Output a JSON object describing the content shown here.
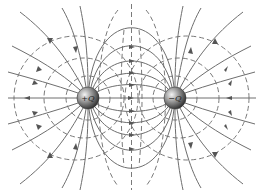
{
  "diagram": {
    "type": "electric-dipole-field",
    "charges": [
      {
        "label": "+Q",
        "sign": "positive",
        "cx": 88,
        "cy": 98,
        "r": 11
      },
      {
        "label": "−Q",
        "sign": "negative",
        "cx": 175,
        "cy": 98,
        "r": 11
      }
    ],
    "field_line_style": "solid",
    "equipotential_style": "dashed",
    "colors": {
      "field_line": "#6e6e6e",
      "equipotential": "#7a7a7a",
      "charge_light": "#e8e8e8",
      "charge_dark": "#3a3a3a",
      "background": "#ffffff"
    }
  }
}
